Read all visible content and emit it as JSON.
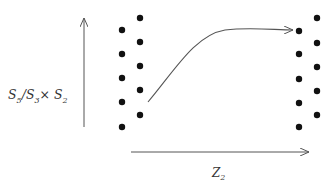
{
  "diagram": {
    "y_axis_label": {
      "base1": "S",
      "sub1": "5",
      "sep": "/",
      "base2": "S",
      "sub2": "3",
      "times": "×",
      "base3": "S",
      "sub3": "2"
    },
    "x_axis_label": {
      "base": "Z",
      "sub": "2"
    },
    "left_dots_col_a": [
      [
        122,
        30
      ],
      [
        122,
        54
      ],
      [
        122,
        78
      ],
      [
        122,
        102
      ],
      [
        122,
        127
      ]
    ],
    "left_dots_col_b": [
      [
        140,
        18
      ],
      [
        140,
        42
      ],
      [
        140,
        66
      ],
      [
        140,
        90
      ],
      [
        140,
        115
      ]
    ],
    "right_dots_col_a": [
      [
        299,
        31
      ],
      [
        299,
        54
      ],
      [
        299,
        79
      ],
      [
        299,
        103
      ],
      [
        299,
        127
      ]
    ],
    "right_dots_col_b": [
      [
        317,
        18
      ],
      [
        317,
        43
      ],
      [
        317,
        67
      ],
      [
        317,
        91
      ],
      [
        317,
        115
      ]
    ],
    "colors": {
      "ink": "#111111",
      "line": "#555555"
    }
  }
}
